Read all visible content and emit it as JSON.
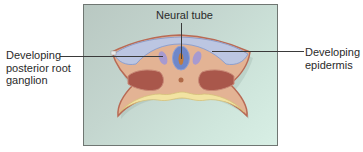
{
  "figure": {
    "labels": {
      "neural_tube": "Neural tube",
      "ganglion_line1": "Developing",
      "ganglion_line2": "posterior root",
      "ganglion_line3": "ganglion",
      "epidermis_line1": "Developing",
      "epidermis_line2": "epidermis"
    },
    "colors": {
      "panel_bg_start": "#b9c8c2",
      "panel_bg_end": "#d8efe5",
      "tissue": "#e2b193",
      "tissue_outline": "#b86a55",
      "somite": "#a8564a",
      "epidermis": "#b9c3df",
      "neural_tube": "#6e86c8",
      "ganglion": "#a99ad0",
      "endoderm": "#f2e2a0"
    }
  }
}
